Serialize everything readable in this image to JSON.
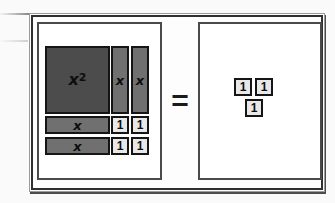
{
  "equation": {
    "equals_sign": "="
  },
  "left_panel": {
    "x_squared_tile": {
      "base": "x",
      "exponent": "2"
    },
    "vertical_x_tiles": [
      "x",
      "x"
    ],
    "horizontal_x_tiles": [
      "x",
      "x"
    ],
    "unit_tiles": [
      "1",
      "1",
      "1",
      "1"
    ]
  },
  "right_panel": {
    "unit_tiles": [
      "1",
      "1",
      "1"
    ]
  },
  "colors": {
    "x_squared_fill": "#4c4c4c",
    "x_fill": "#707070",
    "unit_fill": "#e8e8e8",
    "tile_border": "#151515",
    "frame_border": "#2f2f2f",
    "panel_border": "#4a4a4a"
  }
}
